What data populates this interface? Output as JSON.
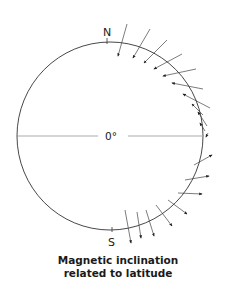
{
  "diagram": {
    "north_label": "N",
    "south_label": "S",
    "equator_label": "0°",
    "caption_line1": "Magnetic inclination",
    "caption_line2": "related to latitude",
    "colors": {
      "circle": "#333333",
      "arrow": "#222222",
      "field_line": "#777777",
      "equator_line": "#888888"
    },
    "north_arrows_count": 11,
    "south_arrows_count": 8
  }
}
